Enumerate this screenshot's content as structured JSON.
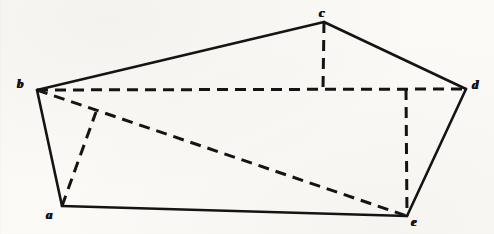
{
  "figure": {
    "canvas": {
      "width": 494,
      "height": 234
    },
    "ink_color": "#141414",
    "paper_color": "#fbfaf7",
    "vertices": [
      {
        "id": "a",
        "label": "a",
        "x": 62,
        "y": 206,
        "label_x": 46,
        "label_y": 208
      },
      {
        "id": "b",
        "label": "b",
        "x": 37,
        "y": 90,
        "label_x": 17,
        "label_y": 77
      },
      {
        "id": "c",
        "label": "c",
        "x": 324,
        "y": 22,
        "label_x": 319,
        "label_y": 6
      },
      {
        "id": "d",
        "label": "d",
        "x": 466,
        "y": 89,
        "label_x": 472,
        "label_y": 78
      },
      {
        "id": "e",
        "label": "e",
        "x": 407,
        "y": 216,
        "label_x": 411,
        "label_y": 215
      }
    ],
    "solid_edges": [
      {
        "name": "edge-b-c",
        "from": "b",
        "to": "c"
      },
      {
        "name": "edge-c-d",
        "from": "c",
        "to": "d"
      },
      {
        "name": "edge-d-e",
        "from": "d",
        "to": "e"
      },
      {
        "name": "edge-e-a",
        "from": "e",
        "to": "a"
      },
      {
        "name": "edge-a-b",
        "from": "a",
        "to": "b"
      }
    ],
    "dashed_edges": [
      {
        "name": "diagonal-b-d",
        "from": "b",
        "to": "d",
        "x1": 37,
        "y1": 90,
        "x2": 466,
        "y2": 89
      },
      {
        "name": "diagonal-b-e",
        "from": "b",
        "to": "e",
        "x1": 37,
        "y1": 90,
        "x2": 407,
        "y2": 216
      },
      {
        "name": "altitude-c-to-bd",
        "from": "c",
        "to": "foot-c",
        "x1": 324,
        "y1": 22,
        "x2": 323,
        "y2": 89
      },
      {
        "name": "altitude-e-to-bd",
        "from": "foot-e",
        "to": "e",
        "x1": 406,
        "y1": 89,
        "x2": 407,
        "y2": 216
      },
      {
        "name": "altitude-a-to-be",
        "from": "a",
        "to": "foot-a",
        "x1": 62,
        "y1": 206,
        "x2": 96,
        "y2": 112
      }
    ],
    "stroke": {
      "solid_width": 2.6,
      "dashed_width": 3.0,
      "dash_pattern": "11 7"
    }
  }
}
